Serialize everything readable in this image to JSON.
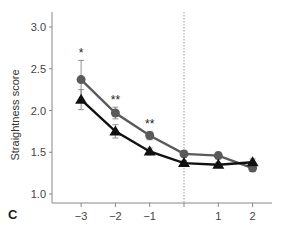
{
  "panel_label": "C",
  "chart_data": {
    "type": "line",
    "title": "",
    "xlabel": "",
    "ylabel": "Straightness score",
    "x": [
      -3,
      -2,
      -1,
      0,
      1,
      2
    ],
    "x_tick_labels": [
      "−3",
      "−2",
      "−1",
      "1",
      "2"
    ],
    "x_ticks": [
      -3,
      -2,
      -1,
      0,
      1,
      2
    ],
    "y_ticks": [
      1.0,
      1.5,
      2.0,
      2.5,
      3.0
    ],
    "y_tick_labels": [
      "1.0",
      "1.5",
      "2.0",
      "2.5",
      "3.0"
    ],
    "ylim": [
      0.9,
      3.2
    ],
    "xlim": [
      -3.8,
      2.4
    ],
    "vertical_reference_line": {
      "x": 0,
      "style": "dotted"
    },
    "grid": false,
    "series": [
      {
        "name": "circle series",
        "marker": "circle",
        "color": "#5a5a5a",
        "values": [
          2.37,
          1.97,
          1.7,
          1.48,
          1.46,
          1.31
        ],
        "error": [
          0.23,
          0.07,
          0.05,
          0.04,
          0.04,
          0.04
        ]
      },
      {
        "name": "triangle series",
        "marker": "triangle",
        "color": "#111111",
        "values": [
          2.13,
          1.75,
          1.51,
          1.37,
          1.35,
          1.38
        ],
        "error": [
          0.12,
          0.08,
          0.04,
          0.03,
          0.03,
          0.04
        ]
      }
    ],
    "annotations": [
      {
        "x": -3,
        "text": "*"
      },
      {
        "x": -2,
        "text": "**"
      },
      {
        "x": -1,
        "text": "**"
      }
    ]
  }
}
